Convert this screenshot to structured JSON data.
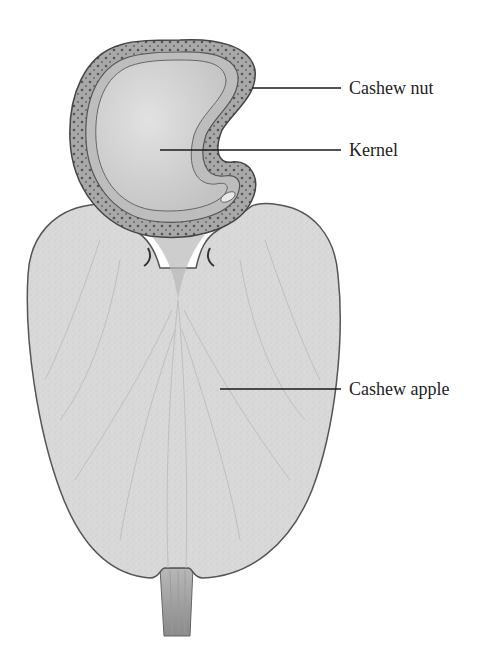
{
  "diagram": {
    "labels": [
      {
        "id": "cashew-nut",
        "text": "Cashew nut",
        "x": 349,
        "y": 79,
        "line": {
          "x1": 252,
          "y1": 88,
          "x2": 341,
          "y2": 88
        }
      },
      {
        "id": "kernel",
        "text": "Kernel",
        "x": 349,
        "y": 141,
        "line": {
          "x1": 160,
          "y1": 150,
          "x2": 341,
          "y2": 150
        }
      },
      {
        "id": "cashew-apple",
        "text": "Cashew apple",
        "x": 349,
        "y": 380,
        "line": {
          "x1": 220,
          "y1": 389,
          "x2": 341,
          "y2": 389
        }
      }
    ],
    "colors": {
      "background": "#ffffff",
      "apple_fill": "#d9d9d9",
      "nut_shell": "#9a9a9a",
      "kernel_fill": "#d6d6d6",
      "outline": "#444444",
      "leader_line": "#1a1a1a",
      "label_text": "#222222"
    }
  }
}
